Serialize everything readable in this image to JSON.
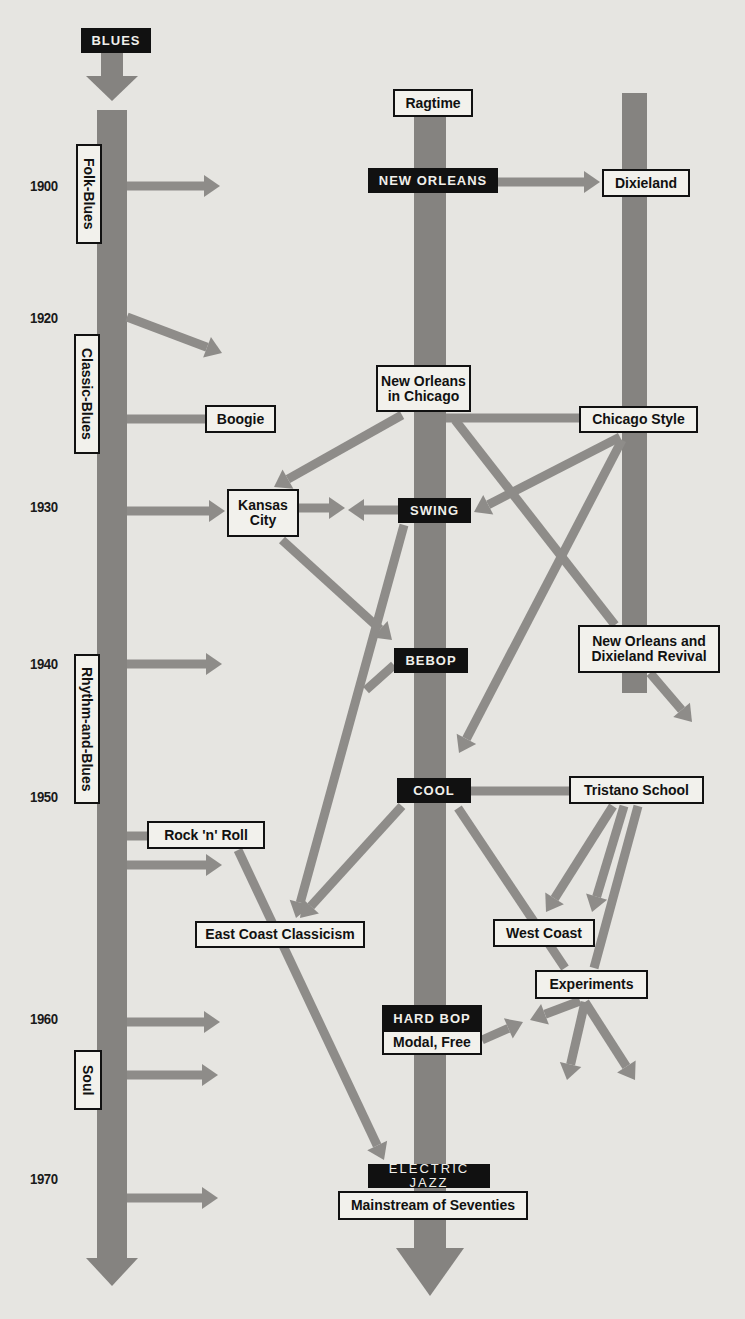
{
  "colors": {
    "background": "#e6e5e1",
    "stem": "#858380",
    "arrow": "#8e8c89",
    "ink": "#111111",
    "box_fill": "#f2f1ec"
  },
  "title": "BLUES",
  "years": [
    {
      "label": "1900",
      "x": 30,
      "y": 177
    },
    {
      "label": "1920",
      "x": 30,
      "y": 309
    },
    {
      "label": "1930",
      "x": 30,
      "y": 498
    },
    {
      "label": "1940",
      "x": 30,
      "y": 655
    },
    {
      "label": "1950",
      "x": 30,
      "y": 788
    },
    {
      "label": "1960",
      "x": 30,
      "y": 1010
    },
    {
      "label": "1970",
      "x": 30,
      "y": 1170
    }
  ],
  "stems": [
    {
      "name": "blues-stem",
      "x": 97,
      "y": 110,
      "w": 30,
      "h": 160,
      "top_arrow": {
        "x": 97,
        "y": 52,
        "w": 30
      }
    },
    {
      "name": "jazz-stem",
      "x": 414,
      "y": 115,
      "w": 32,
      "h": 1110
    },
    {
      "name": "dixieland-stem",
      "x": 622,
      "y": 93,
      "w": 25,
      "h": 200
    }
  ],
  "blues_eras": [
    {
      "label": "Folk-Blues",
      "x": 76,
      "y": 144,
      "w": 26,
      "h": 100
    },
    {
      "label": "Classic-Blues",
      "x": 74,
      "y": 334,
      "w": 26,
      "h": 120
    },
    {
      "label": "Rhythm-and-Blues",
      "x": 74,
      "y": 654,
      "w": 26,
      "h": 150
    },
    {
      "label": "Soul",
      "x": 74,
      "y": 1050,
      "w": 28,
      "h": 60
    }
  ],
  "styles": [
    {
      "id": "ragtime",
      "label": "Ragtime",
      "kind": "light",
      "x": 393,
      "y": 89,
      "w": 80,
      "h": 28
    },
    {
      "id": "new-orleans",
      "label": "NEW ORLEANS",
      "kind": "dark",
      "x": 368,
      "y": 168,
      "w": 130,
      "h": 25
    },
    {
      "id": "dixieland",
      "label": "Dixieland",
      "kind": "light",
      "x": 602,
      "y": 169,
      "w": 88,
      "h": 28
    },
    {
      "id": "new-orleans-in-chicago",
      "label": "New Orleans\nin Chicago",
      "kind": "light",
      "x": 376,
      "y": 365,
      "w": 95,
      "h": 47
    },
    {
      "id": "boogie",
      "label": "Boogie",
      "kind": "light",
      "x": 205,
      "y": 405,
      "w": 71,
      "h": 28
    },
    {
      "id": "chicago-style",
      "label": "Chicago Style",
      "kind": "light",
      "x": 579,
      "y": 406,
      "w": 119,
      "h": 27
    },
    {
      "id": "kansas-city",
      "label": "Kansas\nCity",
      "kind": "light",
      "x": 227,
      "y": 489,
      "w": 72,
      "h": 48
    },
    {
      "id": "swing",
      "label": "SWING",
      "kind": "dark",
      "x": 398,
      "y": 498,
      "w": 73,
      "h": 25
    },
    {
      "id": "bebop",
      "label": "BEBOP",
      "kind": "dark",
      "x": 394,
      "y": 648,
      "w": 74,
      "h": 25
    },
    {
      "id": "new-orleans-dixieland-revival",
      "label": "New Orleans and\nDixieland Revival",
      "kind": "light",
      "x": 578,
      "y": 625,
      "w": 142,
      "h": 48
    },
    {
      "id": "cool",
      "label": "COOL",
      "kind": "dark",
      "x": 397,
      "y": 778,
      "w": 74,
      "h": 25
    },
    {
      "id": "tristano-school",
      "label": "Tristano School",
      "kind": "light",
      "x": 569,
      "y": 776,
      "w": 135,
      "h": 28
    },
    {
      "id": "rock-n-roll",
      "label": "Rock 'n' Roll",
      "kind": "light",
      "x": 147,
      "y": 821,
      "w": 118,
      "h": 28
    },
    {
      "id": "east-coast-classicism",
      "label": "East Coast Classicism",
      "kind": "light",
      "x": 195,
      "y": 921,
      "w": 170,
      "h": 27
    },
    {
      "id": "west-coast",
      "label": "West Coast",
      "kind": "light",
      "x": 493,
      "y": 919,
      "w": 102,
      "h": 28
    },
    {
      "id": "experiments",
      "label": "Experiments",
      "kind": "light",
      "x": 535,
      "y": 970,
      "w": 113,
      "h": 29
    },
    {
      "id": "hard-bop",
      "label": "HARD BOP",
      "kind": "dark",
      "x": 382,
      "y": 1005,
      "w": 100,
      "h": 27
    },
    {
      "id": "modal-free",
      "label": "Modal, Free",
      "kind": "light",
      "x": 382,
      "y": 1030,
      "w": 100,
      "h": 25
    },
    {
      "id": "electric-jazz",
      "label": "ELECTRIC JAZZ",
      "kind": "darkthin",
      "x": 368,
      "y": 1164,
      "w": 122,
      "h": 24
    },
    {
      "id": "mainstream-seventies",
      "label": "Mainstream of Seventies",
      "kind": "light",
      "x": 338,
      "y": 1191,
      "w": 190,
      "h": 29
    }
  ],
  "connections": [
    {
      "from": "blues",
      "to": "jazz",
      "year": "1900",
      "x1": 127,
      "y1": 186,
      "x2": 220,
      "y2": 186,
      "head": true
    },
    {
      "from": "new-orleans",
      "to": "dixieland",
      "x1": 498,
      "y1": 182,
      "x2": 600,
      "y2": 182,
      "head": true
    },
    {
      "from": "blues",
      "to": "jazz",
      "year": "1920",
      "x1": 127,
      "y1": 317,
      "x2": 222,
      "y2": 353,
      "head": true
    },
    {
      "from": "blues",
      "to": "boogie",
      "x1": 127,
      "y1": 419,
      "x2": 205,
      "y2": 419,
      "head": false
    },
    {
      "from": "new-orleans-in-chicago",
      "to": "chicago-style",
      "x1": 446,
      "y1": 418,
      "x2": 579,
      "y2": 418,
      "head": false
    },
    {
      "from": "new-orleans-in-chicago",
      "to": "kansas-city",
      "x1": 402,
      "y1": 415,
      "x2": 274,
      "y2": 487,
      "head": true
    },
    {
      "from": "blues",
      "to": "kansas-city",
      "x1": 127,
      "y1": 511,
      "x2": 225,
      "y2": 511,
      "head": true
    },
    {
      "from": "kansas-city",
      "to": "swing",
      "x1": 299,
      "y1": 508,
      "x2": 345,
      "y2": 508,
      "head": true
    },
    {
      "from": "swing",
      "to": "kansas-city",
      "x1": 398,
      "y1": 510,
      "x2": 348,
      "y2": 510,
      "head": true
    },
    {
      "from": "chicago-style",
      "to": "swing",
      "x1": 620,
      "y1": 437,
      "x2": 474,
      "y2": 512,
      "head": true
    },
    {
      "from": "new-orleans-in-chicago",
      "to": "revival",
      "x1": 455,
      "y1": 420,
      "x2": 615,
      "y2": 625,
      "head": false
    },
    {
      "from": "revival",
      "to": "beyond",
      "x1": 650,
      "y1": 673,
      "x2": 692,
      "y2": 722,
      "head": true
    },
    {
      "from": "chicago-style",
      "to": "cool",
      "x1": 622,
      "y1": 440,
      "x2": 459,
      "y2": 753,
      "head": true
    },
    {
      "from": "kansas-city",
      "to": "bebop",
      "x1": 282,
      "y1": 540,
      "x2": 392,
      "y2": 640,
      "head": true
    },
    {
      "from": "swing",
      "to": "east-coast",
      "x1": 404,
      "y1": 525,
      "x2": 296,
      "y2": 918,
      "head": true
    },
    {
      "from": "bebop",
      "to": "trunk-branch",
      "x1": 394,
      "y1": 665,
      "x2": 366,
      "y2": 690,
      "head": false
    },
    {
      "from": "blues",
      "to": "jazz",
      "year": "1940",
      "x1": 127,
      "y1": 664,
      "x2": 222,
      "y2": 664,
      "head": true
    },
    {
      "from": "cool",
      "to": "tristano-school",
      "x1": 471,
      "y1": 791,
      "x2": 569,
      "y2": 791,
      "head": false
    },
    {
      "from": "cool",
      "to": "east-coast",
      "x1": 402,
      "y1": 806,
      "x2": 300,
      "y2": 918,
      "head": true
    },
    {
      "from": "cool",
      "to": "experiments",
      "x1": 458,
      "y1": 808,
      "x2": 565,
      "y2": 968,
      "head": false
    },
    {
      "from": "tristano-school",
      "to": "west-coast",
      "x1": 613,
      "y1": 806,
      "x2": 546,
      "y2": 912,
      "head": true
    },
    {
      "from": "tristano-school",
      "to": "west-coast-right",
      "x1": 624,
      "y1": 806,
      "x2": 592,
      "y2": 912,
      "head": true
    },
    {
      "from": "tristano-school",
      "to": "experiments",
      "x1": 638,
      "y1": 806,
      "x2": 594,
      "y2": 968,
      "head": false
    },
    {
      "from": "blues",
      "to": "rock-n-roll",
      "x1": 127,
      "y1": 836,
      "x2": 147,
      "y2": 836,
      "head": false
    },
    {
      "from": "blues",
      "to": "jazz",
      "year": "1955",
      "x1": 127,
      "y1": 865,
      "x2": 222,
      "y2": 865,
      "head": true
    },
    {
      "from": "rock-n-roll",
      "to": "electric-jazz",
      "x1": 238,
      "y1": 850,
      "x2": 384,
      "y2": 1160,
      "head": true
    },
    {
      "from": "experiments",
      "to": "hard-bop",
      "x1": 580,
      "y1": 1001,
      "x2": 530,
      "y2": 1020,
      "head": true
    },
    {
      "from": "modal-free",
      "to": "experiments",
      "x1": 482,
      "y1": 1040,
      "x2": 523,
      "y2": 1022,
      "head": true
    },
    {
      "from": "experiments",
      "to": "beyond-left",
      "x1": 585,
      "y1": 1002,
      "x2": 567,
      "y2": 1080,
      "head": true
    },
    {
      "from": "experiments",
      "to": "beyond-right",
      "x1": 585,
      "y1": 1002,
      "x2": 635,
      "y2": 1080,
      "head": true
    },
    {
      "from": "blues",
      "to": "jazz",
      "year": "1960",
      "x1": 127,
      "y1": 1022,
      "x2": 220,
      "y2": 1022,
      "head": true
    },
    {
      "from": "blues",
      "to": "jazz",
      "year": "1965",
      "x1": 127,
      "y1": 1075,
      "x2": 218,
      "y2": 1075,
      "head": true
    },
    {
      "from": "blues",
      "to": "jazz",
      "year": "1970",
      "x1": 127,
      "y1": 1198,
      "x2": 218,
      "y2": 1198,
      "head": true
    }
  ]
}
